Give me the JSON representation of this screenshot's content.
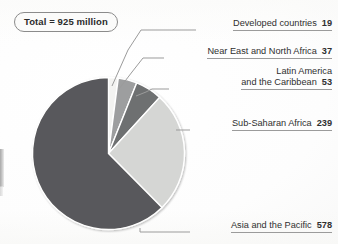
{
  "figure": {
    "total_badge": "Total = 925 million",
    "background_color": "#ffffff"
  },
  "chart_data": {
    "type": "pie",
    "title": "",
    "subtitle": "",
    "unit": "million",
    "total": 925,
    "total_label": "Total = 925 million",
    "categories": [
      "Developed countries",
      "Near East and North Africa",
      "Latin America and the Caribbean",
      "Sub-Saharan Africa",
      "Asia and the Pacific"
    ],
    "values": [
      19,
      37,
      53,
      239,
      578
    ],
    "colors": [
      "#f3f3f1",
      "#9d9e9f",
      "#6e6f71",
      "#d5d6d4",
      "#59595b"
    ],
    "legend_position": "right-callouts",
    "grid": false,
    "start_angle_deg": 0,
    "direction": "clockwise",
    "slices": [
      {
        "label": "Developed countries",
        "value": 19,
        "color": "#f3f3f1",
        "percent": 2.1
      },
      {
        "label": "Near East and North Africa",
        "value": 37,
        "color": "#9d9e9f",
        "percent": 4.0
      },
      {
        "label": "Latin America and the Caribbean",
        "value": 53,
        "color": "#6e6f71",
        "percent": 5.7
      },
      {
        "label": "Sub-Saharan Africa",
        "value": 239,
        "color": "#d5d6d4",
        "percent": 25.8
      },
      {
        "label": "Asia and the Pacific",
        "value": 578,
        "color": "#59595b",
        "percent": 62.5
      }
    ]
  },
  "callouts": [
    {
      "line1": "Developed countries",
      "line2": "",
      "value": "19"
    },
    {
      "line1": "Near East and North Africa",
      "line2": "",
      "value": "37"
    },
    {
      "line1": "Latin America",
      "line2": "and the Caribbean",
      "value": "53"
    },
    {
      "line1": "Sub-Saharan Africa",
      "line2": "",
      "value": "239"
    },
    {
      "line1": "Asia and the Pacific",
      "line2": "",
      "value": "578"
    }
  ]
}
